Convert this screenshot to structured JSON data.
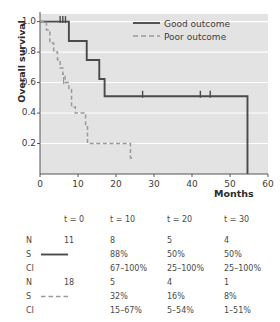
{
  "chart_data": {
    "type": "line",
    "subtype": "kaplan-meier-step",
    "title": "",
    "xlabel": "Months",
    "ylabel": "Overall survival",
    "xlim": [
      0,
      60
    ],
    "ylim": [
      0,
      1.05
    ],
    "xticks": [
      0,
      10,
      20,
      30,
      40,
      50,
      60
    ],
    "xticklabels": [
      "0",
      "10",
      "20",
      "30",
      "40",
      "50",
      "60"
    ],
    "yticks": [
      0.2,
      0.4,
      0.6,
      0.8,
      1.0
    ],
    "yticklabels": [
      "0.2",
      "0.4",
      "0.6",
      "0.8",
      "1.0"
    ],
    "grid": "horizontal-white-on-gray",
    "legend_position": "top-right",
    "series": [
      {
        "name": "Good outcome",
        "style": "solid",
        "color": "#4a4a4a",
        "n_at_risk_start": 11,
        "steps": [
          [
            0,
            1.0
          ],
          [
            7.6,
            1.0
          ],
          [
            7.6,
            0.873
          ],
          [
            12.3,
            0.873
          ],
          [
            12.3,
            0.748
          ],
          [
            15.6,
            0.748
          ],
          [
            15.6,
            0.623
          ],
          [
            17.0,
            0.623
          ],
          [
            17.0,
            0.51
          ],
          [
            54.6,
            0.51
          ],
          [
            54.6,
            0.0
          ]
        ],
        "censor_marks": [
          [
            5.3,
            1.0
          ],
          [
            6.0,
            1.0
          ],
          [
            6.7,
            1.0
          ],
          [
            27.0,
            0.51
          ],
          [
            42.2,
            0.51
          ],
          [
            44.8,
            0.51
          ]
        ]
      },
      {
        "name": "Poor outcome",
        "style": "dashed",
        "color": "#9a9a9a",
        "n_at_risk_start": 18,
        "steps": [
          [
            0,
            1.0
          ],
          [
            1.7,
            1.0
          ],
          [
            1.7,
            0.945
          ],
          [
            2.6,
            0.945
          ],
          [
            2.6,
            0.86
          ],
          [
            3.6,
            0.86
          ],
          [
            3.6,
            0.8
          ],
          [
            4.6,
            0.8
          ],
          [
            4.6,
            0.75
          ],
          [
            5.3,
            0.75
          ],
          [
            5.3,
            0.695
          ],
          [
            6.0,
            0.695
          ],
          [
            6.0,
            0.655
          ],
          [
            6.6,
            0.655
          ],
          [
            6.6,
            0.6
          ],
          [
            7.6,
            0.6
          ],
          [
            7.6,
            0.555
          ],
          [
            8.3,
            0.555
          ],
          [
            8.3,
            0.44
          ],
          [
            9.3,
            0.44
          ],
          [
            9.3,
            0.4
          ],
          [
            12.0,
            0.4
          ],
          [
            12.0,
            0.325
          ],
          [
            12.5,
            0.325
          ],
          [
            12.5,
            0.2
          ],
          [
            23.8,
            0.2
          ],
          [
            23.8,
            0.105
          ],
          [
            24.8,
            0.105
          ]
        ],
        "censor_marks": [
          [
            6.2,
            0.6
          ]
        ]
      }
    ],
    "legend": [
      {
        "label": "Good outcome",
        "style": "solid",
        "color": "#4a4a4a"
      },
      {
        "label": "Poor outcome",
        "style": "dashed",
        "color": "#9a9a9a"
      }
    ]
  },
  "chart": {
    "ylabel": "Overall survival",
    "xlabel": "Months",
    "yticklabels": [
      "1.0",
      "0.8",
      "0.6",
      "0.4",
      "0.2"
    ],
    "xticklabels": [
      "0",
      "10",
      "20",
      "30",
      "40",
      "50",
      "60"
    ],
    "legend": {
      "good": "Good outcome",
      "poor": "Poor outcome"
    }
  },
  "risk_table": {
    "column_headers": [
      "t = 0",
      "t = 10",
      "t = 20",
      "t = 30"
    ],
    "row_labels": [
      "N",
      "S",
      "CI"
    ],
    "groups": [
      {
        "name": "Good outcome",
        "line_style": "solid",
        "N": [
          "11",
          "8",
          "5",
          "4"
        ],
        "S": [
          "",
          "88%",
          "50%",
          "50%"
        ],
        "CI": [
          "",
          "67–100%",
          "25–100%",
          "25–100%"
        ]
      },
      {
        "name": "Poor outcome",
        "line_style": "dashed",
        "N": [
          "18",
          "5",
          "4",
          "1"
        ],
        "S": [
          "",
          "32%",
          "16%",
          "8%"
        ],
        "CI": [
          "",
          "15–67%",
          "5–54%",
          "1–51%"
        ]
      }
    ]
  },
  "colors": {
    "plot_background": "#e3e3e3",
    "gridline": "#ffffff",
    "solid_series": "#4a4a4a",
    "dashed_series": "#9a9a9a",
    "text": "#3d3d3d",
    "axis": "#555555"
  }
}
